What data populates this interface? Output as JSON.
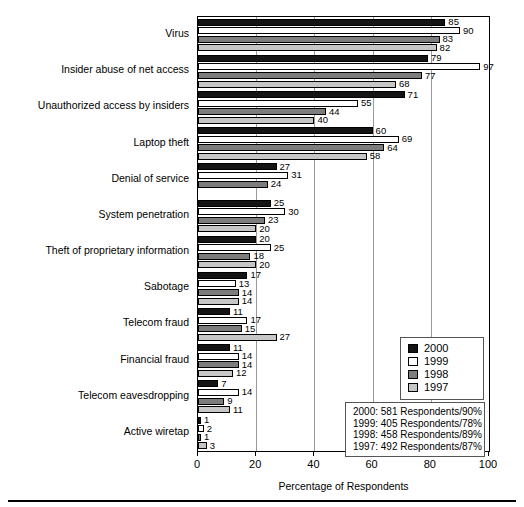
{
  "chart_data": {
    "type": "bar",
    "orientation": "horizontal",
    "title": "",
    "xlabel": "Percentage of Respondents",
    "ylabel": "",
    "xlim": [
      0,
      100
    ],
    "xticks": [
      0,
      20,
      40,
      60,
      80,
      100
    ],
    "grid": true,
    "legend_position": "right-lower",
    "categories": [
      "Virus",
      "Insider abuse of net access",
      "Unauthorized access by insiders",
      "Laptop theft",
      "Denial of service",
      "System penetration",
      "Theft of proprietary information",
      "Sabotage",
      "Telecom fraud",
      "Financial fraud",
      "Telecom eavesdropping",
      "Active wiretap"
    ],
    "series": [
      {
        "name": "2000",
        "color": "#141414",
        "values": [
          85,
          79,
          71,
          60,
          27,
          25,
          20,
          17,
          11,
          11,
          7,
          1
        ]
      },
      {
        "name": "1999",
        "color": "#ffffff",
        "values": [
          90,
          97,
          55,
          69,
          31,
          30,
          25,
          13,
          17,
          14,
          14,
          2
        ]
      },
      {
        "name": "1998",
        "color": "#7d7d7d",
        "values": [
          83,
          77,
          44,
          64,
          24,
          23,
          18,
          14,
          15,
          14,
          9,
          1
        ]
      },
      {
        "name": "1997",
        "color": "#c6c6c6",
        "values": [
          82,
          68,
          40,
          58,
          null,
          20,
          20,
          14,
          27,
          12,
          11,
          3
        ]
      }
    ],
    "annotations": [
      "2000:  581 Respondents/90%",
      "1999:  405 Respondents/78%",
      "1998:  458 Respondents/89%",
      "1997:  492 Respondents/87%"
    ]
  },
  "legend": {
    "entries": [
      {
        "label": "2000",
        "swatch": "y2000"
      },
      {
        "label": "1999",
        "swatch": "y1999"
      },
      {
        "label": "1998",
        "swatch": "y1998"
      },
      {
        "label": "1997",
        "swatch": "y1997"
      }
    ]
  }
}
